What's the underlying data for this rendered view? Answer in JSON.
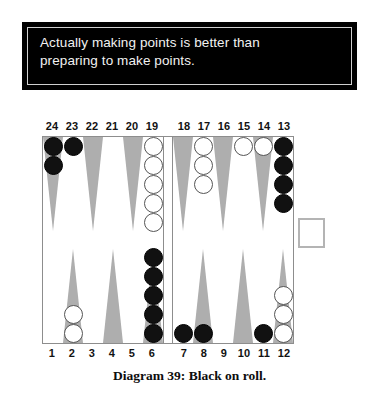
{
  "quote": {
    "text": "Actually making points is better than\npreparing to make points."
  },
  "caption": {
    "text": "Diagram 39:  Black on roll."
  },
  "board": {
    "top_numbers_left": [
      "24",
      "23",
      "22",
      "21",
      "20",
      "19"
    ],
    "top_numbers_right": [
      "18",
      "17",
      "16",
      "15",
      "14",
      "13"
    ],
    "bottom_numbers_left": [
      "1",
      "2",
      "3",
      "4",
      "5",
      "6"
    ],
    "bottom_numbers_right": [
      "7",
      "8",
      "9",
      "10",
      "11",
      "12"
    ],
    "colors": {
      "black_checker": "#111111",
      "white_checker": "#ffffff",
      "point_shaded": "#aeaeae",
      "point_plain": "#ffffff",
      "board_border": "#8d8d8d"
    },
    "cube": {
      "value": "",
      "label": "doubling-cube"
    },
    "points": [
      {
        "point": "24",
        "quadrant": "top-left",
        "tri": "shaded",
        "checkers": 2,
        "color": "black"
      },
      {
        "point": "23",
        "quadrant": "top-left",
        "tri": "plain",
        "checkers": 1,
        "color": "black"
      },
      {
        "point": "22",
        "quadrant": "top-left",
        "tri": "shaded",
        "checkers": 0,
        "color": ""
      },
      {
        "point": "21",
        "quadrant": "top-left",
        "tri": "plain",
        "checkers": 0,
        "color": ""
      },
      {
        "point": "20",
        "quadrant": "top-left",
        "tri": "shaded",
        "checkers": 0,
        "color": ""
      },
      {
        "point": "19",
        "quadrant": "top-left",
        "tri": "plain",
        "checkers": 5,
        "color": "white"
      },
      {
        "point": "18",
        "quadrant": "top-right",
        "tri": "shaded",
        "checkers": 0,
        "color": ""
      },
      {
        "point": "17",
        "quadrant": "top-right",
        "tri": "plain",
        "checkers": 3,
        "color": "white"
      },
      {
        "point": "16",
        "quadrant": "top-right",
        "tri": "shaded",
        "checkers": 0,
        "color": ""
      },
      {
        "point": "15",
        "quadrant": "top-right",
        "tri": "plain",
        "checkers": 1,
        "color": "white"
      },
      {
        "point": "14",
        "quadrant": "top-right",
        "tri": "shaded",
        "checkers": 1,
        "color": "white"
      },
      {
        "point": "13",
        "quadrant": "top-right",
        "tri": "plain",
        "checkers": 4,
        "color": "black"
      },
      {
        "point": "1",
        "quadrant": "bottom-left",
        "tri": "plain",
        "checkers": 0,
        "color": ""
      },
      {
        "point": "2",
        "quadrant": "bottom-left",
        "tri": "shaded",
        "checkers": 2,
        "color": "white"
      },
      {
        "point": "3",
        "quadrant": "bottom-left",
        "tri": "plain",
        "checkers": 0,
        "color": ""
      },
      {
        "point": "4",
        "quadrant": "bottom-left",
        "tri": "shaded",
        "checkers": 0,
        "color": ""
      },
      {
        "point": "5",
        "quadrant": "bottom-left",
        "tri": "plain",
        "checkers": 0,
        "color": ""
      },
      {
        "point": "6",
        "quadrant": "bottom-left",
        "tri": "shaded",
        "checkers": 5,
        "color": "black"
      },
      {
        "point": "7",
        "quadrant": "bottom-right",
        "tri": "plain",
        "checkers": 1,
        "color": "black"
      },
      {
        "point": "8",
        "quadrant": "bottom-right",
        "tri": "shaded",
        "checkers": 1,
        "color": "black"
      },
      {
        "point": "9",
        "quadrant": "bottom-right",
        "tri": "plain",
        "checkers": 0,
        "color": ""
      },
      {
        "point": "10",
        "quadrant": "bottom-right",
        "tri": "shaded",
        "checkers": 0,
        "color": ""
      },
      {
        "point": "11",
        "quadrant": "bottom-right",
        "tri": "plain",
        "checkers": 1,
        "color": "black"
      },
      {
        "point": "12",
        "quadrant": "bottom-right",
        "tri": "shaded",
        "checkers": 3,
        "color": "white"
      }
    ]
  }
}
